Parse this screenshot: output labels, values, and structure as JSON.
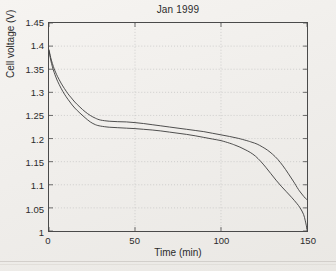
{
  "chart_data": {
    "type": "line",
    "title": "Jan 1999",
    "xlabel": "Time (min)",
    "ylabel": "Cell voltage (V)",
    "xlim": [
      0,
      150
    ],
    "ylim": [
      1,
      1.45
    ],
    "xticks": [
      0,
      50,
      100,
      150
    ],
    "yticks": [
      1,
      1.05,
      1.1,
      1.15,
      1.2,
      1.25,
      1.3,
      1.35,
      1.4,
      1.45
    ],
    "xtick_labels": [
      "0",
      "50",
      "100",
      "150"
    ],
    "ytick_labels": [
      "1",
      "1.05",
      "1.1",
      "1.15",
      "1.2",
      "1.25",
      "1.3",
      "1.35",
      "1.4",
      "1.45"
    ],
    "grid": true,
    "grid_style": "dotted",
    "legend": null,
    "line_color": "#3a3a3a",
    "series": [
      {
        "name": "upper-discharge-curve",
        "x": [
          0,
          1,
          2,
          3,
          4,
          5,
          7,
          9,
          11,
          13,
          15,
          18,
          21,
          24,
          27,
          30,
          35,
          40,
          45,
          50,
          55,
          60,
          65,
          70,
          75,
          80,
          85,
          90,
          95,
          100,
          105,
          110,
          115,
          118,
          121,
          124,
          127,
          130,
          133,
          136,
          139,
          142,
          145,
          147,
          149,
          150
        ],
        "y": [
          1.392,
          1.375,
          1.362,
          1.351,
          1.342,
          1.334,
          1.32,
          1.308,
          1.297,
          1.288,
          1.279,
          1.268,
          1.258,
          1.25,
          1.244,
          1.24,
          1.2375,
          1.2365,
          1.236,
          1.2345,
          1.2325,
          1.23,
          1.2275,
          1.225,
          1.2225,
          1.22,
          1.2175,
          1.215,
          1.2115,
          1.208,
          1.2045,
          1.2005,
          1.1955,
          1.192,
          1.188,
          1.182,
          1.175,
          1.166,
          1.155,
          1.141,
          1.125,
          1.108,
          1.09,
          1.08,
          1.071,
          1.068
        ]
      },
      {
        "name": "lower-discharge-curve",
        "x": [
          0,
          1,
          2,
          3,
          4,
          5,
          7,
          9,
          11,
          13,
          15,
          18,
          21,
          24,
          27,
          30,
          35,
          40,
          45,
          50,
          55,
          60,
          65,
          70,
          75,
          80,
          85,
          90,
          95,
          100,
          105,
          108,
          111,
          114,
          117,
          120,
          123,
          126,
          129,
          132,
          135,
          138,
          141,
          144,
          146,
          148,
          149,
          150
        ],
        "y": [
          1.39,
          1.37,
          1.355,
          1.343,
          1.333,
          1.324,
          1.309,
          1.296,
          1.285,
          1.275,
          1.266,
          1.255,
          1.245,
          1.236,
          1.23,
          1.227,
          1.2245,
          1.2235,
          1.2225,
          1.2215,
          1.22,
          1.2185,
          1.2165,
          1.214,
          1.2115,
          1.209,
          1.206,
          1.2025,
          1.199,
          1.1955,
          1.19,
          1.186,
          1.1815,
          1.176,
          1.17,
          1.162,
          1.151,
          1.138,
          1.124,
          1.11,
          1.097,
          1.085,
          1.073,
          1.06,
          1.05,
          1.036,
          1.022,
          1.005
        ]
      }
    ]
  }
}
